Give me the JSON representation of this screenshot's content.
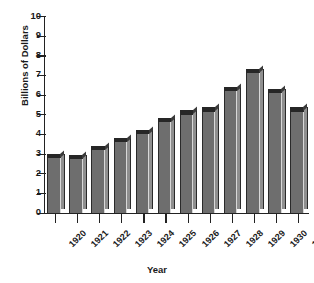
{
  "chart_data": {
    "type": "bar",
    "title": "",
    "xlabel": "Year",
    "ylabel": "Billions of Dollars",
    "categories": [
      "1920",
      "1921",
      "1922",
      "1923",
      "1924",
      "1925",
      "1926",
      "1927",
      "1928",
      "1929",
      "1930",
      "1931"
    ],
    "values": [
      3.0,
      2.95,
      3.4,
      3.8,
      4.2,
      4.8,
      5.2,
      5.35,
      6.4,
      7.3,
      6.3,
      5.35
    ],
    "ylim": [
      0,
      10
    ],
    "yticks": [
      0,
      1,
      2,
      3,
      4,
      5,
      6,
      7,
      8,
      9,
      10
    ],
    "ytick_labels": [
      "0",
      "1",
      "2",
      "3",
      "4",
      "5",
      "6",
      "7",
      "8",
      "9",
      "10"
    ],
    "grid": false,
    "legend": null,
    "bar_style": "3d-extruded",
    "colors": {
      "bar_front": "#6e6e6e",
      "bar_side": "#8f8f8f",
      "bar_top": "#262626",
      "axis": "#222222",
      "text": "#1a1a1a",
      "background": "#ffffff"
    }
  }
}
